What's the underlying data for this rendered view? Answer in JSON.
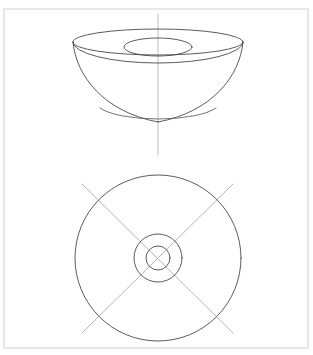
{
  "drawing": {
    "title": "Orthographic drawing of a hollow bowl / toroidal dish",
    "background_color": "#ffffff",
    "frame": {
      "name": "drawing-frame",
      "x": 4,
      "y": 9,
      "width": 304,
      "height": 339,
      "stroke_color": "#d9d9d9"
    },
    "colors": {
      "outline": "#4a4a4a",
      "outline_soft": "#5c5c5c",
      "centerline": "#b4b4b4",
      "centerline_diagonal": "#a8a8a8",
      "frame": "#d9d9d9"
    },
    "views": [
      {
        "id": "isometric-view",
        "label": "Isometric / pictorial view of bowl",
        "position": "top",
        "center_x": 158,
        "elements": [
          {
            "id": "rim-outer-ellipse",
            "label": "Outer rim ellipse",
            "shape": "ellipse",
            "cx": 158,
            "cy": 42,
            "rx": 85,
            "ry": 13
          },
          {
            "id": "bore-inner-ellipse",
            "label": "Inner bore ellipse",
            "shape": "ellipse",
            "cx": 158,
            "cy": 47,
            "rx": 34,
            "ry": 9
          },
          {
            "id": "rim-front-arc",
            "label": "Front edge of rim band",
            "shape": "arc",
            "from_x": 73,
            "from_y": 42,
            "to_x": 243,
            "to_y": 42,
            "rx": 85,
            "ry": 21,
            "sweep": 1
          },
          {
            "id": "wall-left-profile",
            "label": "Left outer wall profile",
            "shape": "curve",
            "from_x": 73,
            "from_y": 42,
            "to_x": 158,
            "to_y": 122
          },
          {
            "id": "wall-right-profile",
            "label": "Right outer wall profile",
            "shape": "curve",
            "from_x": 243,
            "from_y": 42,
            "to_x": 158,
            "to_y": 122
          },
          {
            "id": "base-arc",
            "label": "Bottom base arc",
            "shape": "arc",
            "cy": 108,
            "rx": 58,
            "ry": 15
          },
          {
            "id": "vertical-centerline",
            "label": "Vertical axis centerline",
            "shape": "line",
            "x1": 158,
            "y1": 14,
            "x2": 158,
            "y2": 155
          }
        ]
      },
      {
        "id": "plan-view",
        "label": "Plan view — concentric circles",
        "position": "bottom",
        "center_x": 158,
        "center_y": 258,
        "elements": [
          {
            "id": "outer-circle",
            "label": "Outer diameter circle",
            "shape": "circle",
            "cx": 158,
            "cy": 258,
            "r": 83
          },
          {
            "id": "middle-circle",
            "label": "Bore outer circle",
            "shape": "circle",
            "cx": 158,
            "cy": 258,
            "r": 24
          },
          {
            "id": "inner-circle",
            "label": "Inner bore circle",
            "shape": "circle",
            "cx": 158,
            "cy": 258,
            "r": 12
          },
          {
            "id": "diagonal-centerline-1",
            "label": "Diagonal centerline (upper-left to lower-right)",
            "shape": "line",
            "x1": 82,
            "y1": 184,
            "x2": 233,
            "y2": 333
          },
          {
            "id": "diagonal-centerline-2",
            "label": "Diagonal centerline (lower-left to upper-right)",
            "shape": "line",
            "x1": 82,
            "y1": 333,
            "x2": 233,
            "y2": 184
          }
        ]
      }
    ]
  }
}
